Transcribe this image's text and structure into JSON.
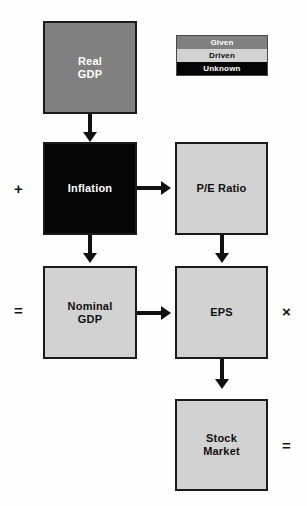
{
  "diagram": {
    "legend": {
      "name": "fill-legend",
      "items": [
        {
          "label": "Given",
          "swatch": "#808080",
          "text_color": "#ffffff"
        },
        {
          "label": "Driven",
          "swatch": "#d2d2d2",
          "text_color": "#111111"
        },
        {
          "label": "Unknown",
          "swatch": "#050505",
          "text_color": "#ffffff"
        }
      ]
    },
    "nodes": [
      {
        "id": "real-gdp",
        "label": "Real\nGDP",
        "category": "Given",
        "fill": "#808080",
        "text_color": "#ffffff"
      },
      {
        "id": "inflation",
        "label": "Inflation",
        "category": "Unknown",
        "fill": "#050505",
        "text_color": "#ffffff"
      },
      {
        "id": "pe-ratio",
        "label": "P/E Ratio",
        "category": "Driven",
        "fill": "#d2d2d2",
        "text_color": "#111111"
      },
      {
        "id": "nominal-gdp",
        "label": "Nominal\nGDP",
        "category": "Driven",
        "fill": "#d2d2d2",
        "text_color": "#111111"
      },
      {
        "id": "eps",
        "label": "EPS",
        "category": "Driven",
        "fill": "#d2d2d2",
        "text_color": "#111111"
      },
      {
        "id": "stock-market",
        "label": "Stock\nMarket",
        "category": "Driven",
        "fill": "#d2d2d2",
        "text_color": "#111111"
      }
    ],
    "operators": [
      {
        "id": "op-plus",
        "symbol": "+",
        "position": "left-of-inflation"
      },
      {
        "id": "op-equals-left",
        "symbol": "=",
        "position": "left-of-nominal-gdp"
      },
      {
        "id": "op-times",
        "symbol": "×",
        "position": "right-of-eps"
      },
      {
        "id": "op-equals-right",
        "symbol": "=",
        "position": "right-of-stock-market"
      }
    ],
    "edges": [
      {
        "from": "real-gdp",
        "to": "inflation",
        "direction": "down"
      },
      {
        "from": "inflation",
        "to": "p-e-ratio",
        "direction": "right"
      },
      {
        "from": "inflation",
        "to": "nominal-gdp",
        "direction": "down"
      },
      {
        "from": "pe-ratio",
        "to": "eps",
        "direction": "down"
      },
      {
        "from": "nominal-gdp",
        "to": "eps",
        "direction": "right"
      },
      {
        "from": "eps",
        "to": "stock-market",
        "direction": "down"
      }
    ]
  }
}
